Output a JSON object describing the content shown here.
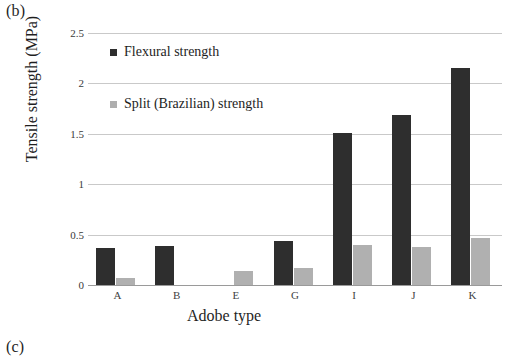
{
  "panels": {
    "current_label": "(b)",
    "next_label": "(c)"
  },
  "legend": {
    "position": "inside-top-left",
    "entries": [
      {
        "label": "Flexural strength",
        "color": "#2e2e2e",
        "marker": "square-swatch-icon"
      },
      {
        "label": "Split (Brazilian) strength",
        "color": "#aeaeae",
        "marker": "square-swatch-icon"
      }
    ]
  },
  "chart_data": {
    "type": "bar",
    "title": "",
    "xlabel": "Adobe type",
    "ylabel": "Tensile strength (MPa)",
    "categories": [
      "A",
      "B",
      "E",
      "G",
      "I",
      "J",
      "K"
    ],
    "series": [
      {
        "name": "Flexural strength",
        "color": "#2e2e2e",
        "values": [
          0.37,
          0.39,
          0,
          0.44,
          1.51,
          1.69,
          2.15
        ]
      },
      {
        "name": "Split (Brazilian) strength",
        "color": "#b0b0b0",
        "values": [
          0.07,
          0,
          0.14,
          0.17,
          0.4,
          0.38,
          0.47
        ]
      }
    ],
    "ylim": [
      0,
      2.5
    ],
    "yticks": [
      0,
      0.5,
      1,
      1.5,
      2,
      2.5
    ],
    "ytick_labels": [
      "0",
      "0.5",
      "1",
      "1.5",
      "2",
      "2.5"
    ],
    "grid": true,
    "grid_axis": "y"
  }
}
